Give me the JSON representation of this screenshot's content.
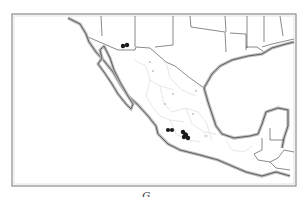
{
  "figure": {
    "type": "distribution-map",
    "region": "Mexico and southern United States",
    "caption": "G. . .",
    "colors": {
      "background": "#ffffff",
      "frame": "#8a8a8a",
      "coastline": "#555555",
      "coast_halo": "#bdbdbd",
      "political_border": "#3a3a3a",
      "state_border": "#c8c8c8",
      "occurrence_marker": "#1a1a1a"
    },
    "occurrence_groups": [
      {
        "name": "sonora-arizona-border",
        "count": 2
      },
      {
        "name": "western-jalisco-michoacan",
        "count": 2
      },
      {
        "name": "central-michoacan-mexico",
        "count": 5
      }
    ],
    "minor_markers_count": 6
  }
}
